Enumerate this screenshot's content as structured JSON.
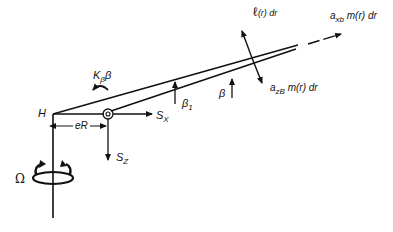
{
  "diagram": {
    "type": "rotor blade flapping free-body diagram",
    "labels": {
      "hub": "H",
      "spring_moment": {
        "main": "K",
        "sub": "β",
        "tail": "β"
      },
      "hinge_offset": "eR",
      "shear_x": {
        "main": "S",
        "sub": "X"
      },
      "shear_z": {
        "main": "S",
        "sub": "Z"
      },
      "beta1": {
        "main": "β",
        "sub": "1"
      },
      "beta": "β",
      "rotation": "Ω",
      "lift": {
        "main": "ℓ",
        "tail": "(r) dr"
      },
      "inertia_z": {
        "main": "a",
        "sub": "zB",
        "tail": " m(r) dr"
      },
      "inertia_x": {
        "main": "a",
        "sub": "xb",
        "tail": " m(r) dr"
      }
    },
    "colors": {
      "ink": "#111111",
      "background": "#ffffff"
    }
  }
}
